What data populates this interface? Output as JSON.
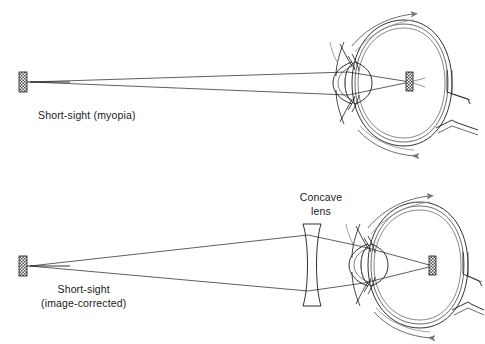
{
  "figure": {
    "background_color": "#ffffff",
    "ink_color": "#1a1a1a"
  },
  "panels": [
    {
      "id": "myopia",
      "caption": "Short-sight (myopia)",
      "caption_lines": [
        "Short-sight (myopia)"
      ],
      "description": "Uncorrected myopic eye: rays from a distant object converge to a focus in front of the retina.",
      "object_label": "object-arrow",
      "image_label": "image-marker-in-front-of-retina"
    },
    {
      "id": "corrected",
      "caption_lines": [
        "Short-sight",
        "(image-corrected)"
      ],
      "caption_line1": "Short-sight",
      "caption_line2": "(image-corrected)",
      "lens_label_lines": [
        "Concave",
        "lens"
      ],
      "lens_label_line1": "Concave",
      "lens_label_line2": "lens",
      "description": "Myopic eye corrected by a biconcave spectacle lens: rays are diverged so the image falls on the retina.",
      "object_label": "object-arrow",
      "image_label": "image-marker-on-retina"
    }
  ],
  "anatomy": {
    "parts": [
      "cornea",
      "crystalline-lens",
      "iris",
      "sclera",
      "choroid",
      "retina",
      "optic-nerve",
      "ciliary-body"
    ]
  }
}
